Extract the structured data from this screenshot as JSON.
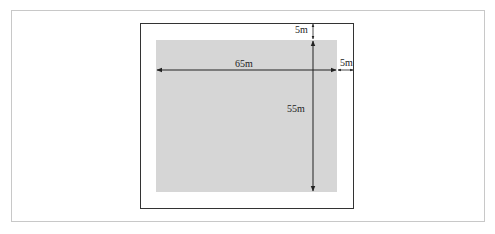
{
  "diagram": {
    "title": "",
    "outer_frame": {
      "x": 140,
      "y": 23,
      "w": 214,
      "h": 186
    },
    "inner_area": {
      "x": 156,
      "y": 40,
      "w": 181,
      "h": 152,
      "fill": "#d6d6d6"
    },
    "labels": {
      "width": "65m",
      "height": "55m",
      "top_margin": "5m",
      "right_margin": "5m"
    },
    "colors": {
      "frame": "#333333",
      "area": "#d6d6d6",
      "arrow": "#222222",
      "panel_border": "#c8c8c8"
    }
  }
}
